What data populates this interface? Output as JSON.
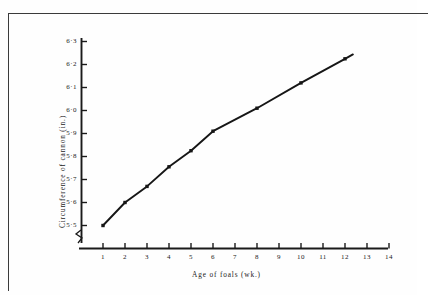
{
  "chart_data": {
    "type": "line",
    "title": "",
    "xlabel": "Age of foals  (wk.)",
    "ylabel": "Circumference of cannon (in.)",
    "x": [
      1,
      2,
      3,
      4,
      5,
      6,
      8,
      10,
      12
    ],
    "values": [
      5.5,
      5.6,
      5.67,
      5.755,
      5.825,
      5.91,
      6.01,
      6.12,
      6.225
    ],
    "series": [
      {
        "name": "Circumference of cannon",
        "values": [
          5.5,
          5.6,
          5.67,
          5.755,
          5.825,
          5.91,
          6.01,
          6.12,
          6.225
        ]
      }
    ],
    "xlim": [
      0,
      14.6
    ],
    "ylim": [
      5.45,
      6.34
    ],
    "xticks": [
      1,
      2,
      3,
      4,
      5,
      6,
      7,
      8,
      9,
      10,
      11,
      12,
      13,
      14
    ],
    "xtick_labels": [
      "1",
      "2",
      "3",
      "4",
      "5",
      "6",
      "7",
      "8",
      "9",
      "10",
      "11",
      "12",
      "13",
      "14"
    ],
    "yticks": [
      5.5,
      5.6,
      5.7,
      5.8,
      5.9,
      6.0,
      6.1,
      6.2,
      6.3
    ],
    "ytick_labels": [
      "5·5",
      "5·6",
      "5·7",
      "5·8",
      "5·9",
      "6·0",
      "6·1",
      "6·2",
      "6·3"
    ],
    "grid": false,
    "legend": "none",
    "marker": "square",
    "line_color": "#161616",
    "marker_color": "#161616",
    "axis_color": "#1a1a1a",
    "background_color": "#fefefe",
    "axis_break": "y-axis break at origin",
    "line_extends_past_last_point": true
  }
}
